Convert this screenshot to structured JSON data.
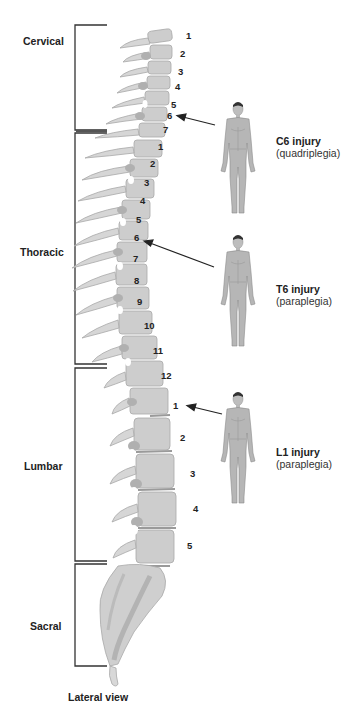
{
  "diagram": {
    "caption": "Lateral view",
    "regions": [
      {
        "label": "Cervical",
        "vertebrae": [
          "1",
          "2",
          "3",
          "4",
          "5",
          "6",
          "7"
        ]
      },
      {
        "label": "Thoracic",
        "vertebrae": [
          "1",
          "2",
          "3",
          "4",
          "5",
          "6",
          "7",
          "8",
          "9",
          "10",
          "11",
          "12"
        ]
      },
      {
        "label": "Lumbar",
        "vertebrae": [
          "1",
          "2",
          "3",
          "4",
          "5"
        ]
      },
      {
        "label": "Sacral",
        "vertebrae": []
      }
    ],
    "injuries": [
      {
        "title": "C6 injury",
        "subtitle": "(quadriplegia)",
        "level": "C6"
      },
      {
        "title": "T6 injury",
        "subtitle": "(paraplegia)",
        "level": "T6"
      },
      {
        "title": "L1 injury",
        "subtitle": "(paraplegia)",
        "level": "L1"
      }
    ],
    "colors": {
      "bone": "#c9c9c9",
      "bone_dark": "#a9a9a9",
      "body_figure": "#b5b5b5",
      "bracket": "#333333",
      "arrow": "#222222"
    }
  }
}
